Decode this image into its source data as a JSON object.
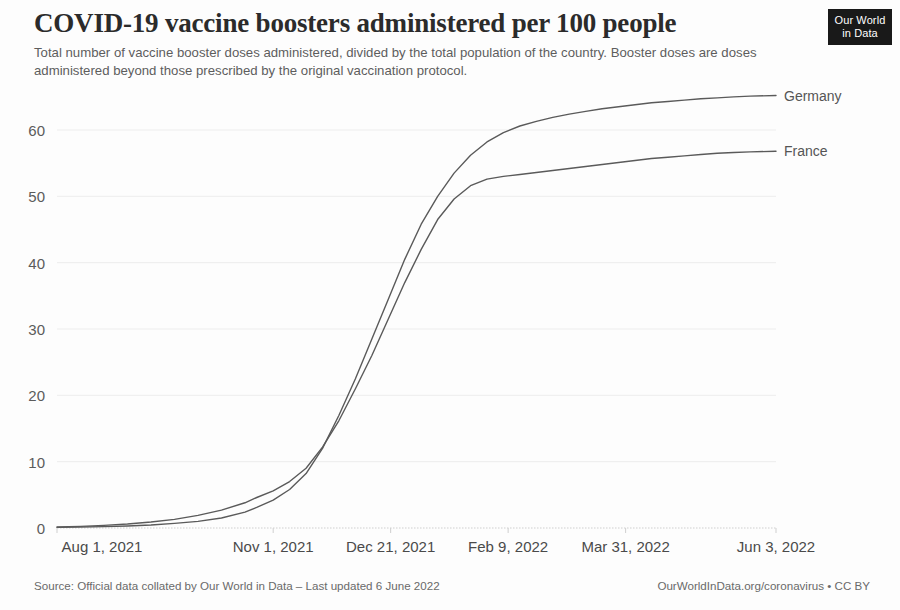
{
  "header": {
    "title": "COVID-19 vaccine boosters administered per 100 people",
    "subtitle": "Total number of vaccine booster doses administered, divided by the total population of the country. Booster doses are doses administered beyond those prescribed by the original vaccination protocol.",
    "logo_line1": "Our World",
    "logo_line2": "in Data"
  },
  "footer": {
    "source": "Source: Official data collated by Our World in Data – Last updated 6 June 2022",
    "license": "OurWorldInData.org/coronavirus • CC BY"
  },
  "colors": {
    "line": "#5a5a5a",
    "grid": "#ededed",
    "axis": "#cfcfcf",
    "logo_bg": "#191919",
    "text": "#4a4a4a"
  },
  "chart_data": {
    "type": "line",
    "title": "COVID-19 vaccine boosters administered per 100 people",
    "subtitle": "Total number of vaccine booster doses administered, divided by the total population of the country. Booster doses are doses administered beyond those prescribed by the original vaccination protocol.",
    "xlabel": "",
    "ylabel": "",
    "ylim": [
      0,
      66
    ],
    "yticks": [
      0,
      10,
      20,
      30,
      40,
      50,
      60
    ],
    "ytick_labels": [
      "0",
      "10",
      "20",
      "30",
      "40",
      "50",
      "60"
    ],
    "xtick_labels": [
      "Aug 1, 2021",
      "Nov 1, 2021",
      "Dec 21, 2021",
      "Feb 9, 2022",
      "Mar 31, 2022",
      "Jun 3, 2022"
    ],
    "xtick_days": [
      0,
      92,
      142,
      192,
      242,
      306
    ],
    "xlim_days": [
      0,
      306
    ],
    "grid": true,
    "legend_position": "right-inline",
    "series": [
      {
        "name": "Germany",
        "label_value": 65.2,
        "x_days": [
          0,
          10,
          20,
          30,
          40,
          50,
          60,
          70,
          80,
          85,
          92,
          99,
          106,
          113,
          120,
          127,
          134,
          141,
          148,
          155,
          162,
          169,
          176,
          183,
          190,
          197,
          204,
          211,
          218,
          225,
          232,
          239,
          246,
          253,
          260,
          267,
          274,
          281,
          288,
          295,
          306
        ],
        "values": [
          0.1,
          0.15,
          0.2,
          0.3,
          0.45,
          0.7,
          1.0,
          1.5,
          2.4,
          3.1,
          4.2,
          5.8,
          8.2,
          12.0,
          17.0,
          22.5,
          28.5,
          34.5,
          40.5,
          45.8,
          50.0,
          53.5,
          56.2,
          58.2,
          59.6,
          60.6,
          61.3,
          61.9,
          62.4,
          62.8,
          63.2,
          63.5,
          63.8,
          64.1,
          64.3,
          64.5,
          64.7,
          64.85,
          65.0,
          65.1,
          65.2
        ]
      },
      {
        "name": "France",
        "label_value": 56.8,
        "x_days": [
          0,
          10,
          20,
          30,
          40,
          50,
          60,
          70,
          80,
          85,
          92,
          99,
          106,
          113,
          120,
          127,
          134,
          141,
          148,
          155,
          162,
          169,
          176,
          183,
          190,
          197,
          204,
          211,
          218,
          225,
          232,
          239,
          246,
          253,
          260,
          267,
          274,
          281,
          288,
          295,
          306
        ],
        "values": [
          0.15,
          0.25,
          0.4,
          0.6,
          0.9,
          1.3,
          1.9,
          2.7,
          3.8,
          4.6,
          5.6,
          7.0,
          9.0,
          12.2,
          16.2,
          21.0,
          26.0,
          31.5,
          37.0,
          42.0,
          46.5,
          49.6,
          51.6,
          52.6,
          53.0,
          53.3,
          53.6,
          53.9,
          54.2,
          54.5,
          54.8,
          55.1,
          55.4,
          55.7,
          55.9,
          56.1,
          56.3,
          56.5,
          56.6,
          56.7,
          56.8
        ]
      }
    ]
  }
}
